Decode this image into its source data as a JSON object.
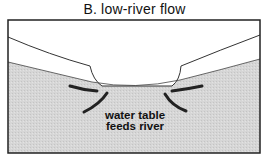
{
  "figure": {
    "title": "B. low-river flow",
    "annotation": {
      "line1": "water table",
      "line2": "feeds river"
    },
    "colors": {
      "ground_fill": "#d6d6d6",
      "outline": "#222222",
      "arrows": "#222222",
      "background": "#ffffff"
    },
    "elements": [
      "ground surface",
      "river channel",
      "water table (shaded)",
      "flow arrows toward river"
    ]
  }
}
